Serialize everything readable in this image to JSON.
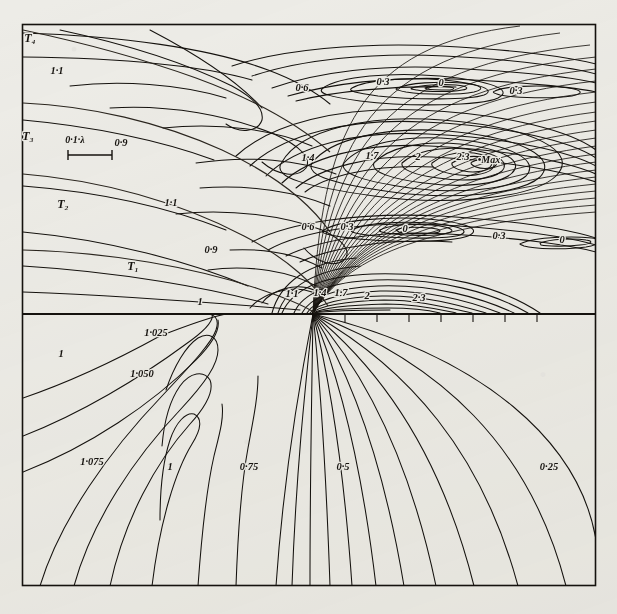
{
  "figure": {
    "kind": "contour-plot",
    "background_color": "#edece7",
    "ink_color": "#15120e",
    "panels": [
      {
        "name": "upper-panel",
        "description": "field intensity contours"
      },
      {
        "name": "lower-panel",
        "description": "near-field contours"
      }
    ],
    "scale_bar": {
      "label": "0·1·λ"
    },
    "max_marker": {
      "label": "•Max"
    }
  },
  "chart_data": {
    "type": "line",
    "title": "",
    "subtitle": "",
    "xlabel": "",
    "ylabel": "",
    "grid": false,
    "legend": "none",
    "axis_divider_y": 314,
    "contour_labels_upper": [
      "1·1",
      "0·9",
      "1·1",
      "0·9",
      "1",
      "0·6",
      "0·3",
      "0",
      "0·3",
      "1·4",
      "1·7",
      "2",
      "2·3",
      "0·6",
      "0·3",
      "0",
      "0·3",
      "0",
      "1·1",
      "1·4",
      "1·7",
      "2",
      "2·3"
    ],
    "contour_labels_lower": [
      "1",
      "1·025",
      "1·050",
      "1·075",
      "1",
      "0·75",
      "0·5",
      "0·25"
    ],
    "ray_labels": [
      "T₁",
      "T₂",
      "T₃",
      "T₄"
    ],
    "annotations": [
      "0·1·λ",
      "•Max"
    ]
  },
  "labels": {
    "rays": [
      {
        "text": "T₄",
        "x": 30,
        "y": 42
      },
      {
        "text": "T₃",
        "x": 28,
        "y": 140
      },
      {
        "text": "T₂",
        "x": 63,
        "y": 208
      },
      {
        "text": "T₁",
        "x": 133,
        "y": 270
      }
    ],
    "scale": {
      "text": "0·1·λ",
      "x": 75,
      "y": 143
    },
    "max": {
      "text": "•Max",
      "x": 489,
      "y": 163
    },
    "upper": [
      {
        "text": "1·1",
        "x": 57,
        "y": 74
      },
      {
        "text": "0·9",
        "x": 121,
        "y": 146
      },
      {
        "text": "1·1",
        "x": 171,
        "y": 206
      },
      {
        "text": "0·9",
        "x": 211,
        "y": 253
      },
      {
        "text": "1",
        "x": 200,
        "y": 305
      },
      {
        "text": "0·6",
        "x": 302,
        "y": 91
      },
      {
        "text": "0·3",
        "x": 383,
        "y": 85
      },
      {
        "text": "0",
        "x": 441,
        "y": 86
      },
      {
        "text": "0·3",
        "x": 516,
        "y": 94
      },
      {
        "text": "1·4",
        "x": 308,
        "y": 161
      },
      {
        "text": "1·7",
        "x": 372,
        "y": 159
      },
      {
        "text": "2",
        "x": 418,
        "y": 160
      },
      {
        "text": "2·3",
        "x": 463,
        "y": 160
      },
      {
        "text": "0·6",
        "x": 308,
        "y": 230
      },
      {
        "text": "0·3",
        "x": 347,
        "y": 230
      },
      {
        "text": "0",
        "x": 405,
        "y": 232
      },
      {
        "text": "0·3",
        "x": 499,
        "y": 239
      },
      {
        "text": "0",
        "x": 562,
        "y": 243
      },
      {
        "text": "1·1",
        "x": 292,
        "y": 297
      },
      {
        "text": "1·4",
        "x": 320,
        "y": 296
      },
      {
        "text": "1·7",
        "x": 341,
        "y": 296
      },
      {
        "text": "2",
        "x": 367,
        "y": 299
      },
      {
        "text": "2·3",
        "x": 419,
        "y": 301
      }
    ],
    "lower": [
      {
        "text": "1",
        "x": 61,
        "y": 357
      },
      {
        "text": "1·025",
        "x": 156,
        "y": 336
      },
      {
        "text": "1·050",
        "x": 142,
        "y": 377
      },
      {
        "text": "1·075",
        "x": 92,
        "y": 465
      },
      {
        "text": "1",
        "x": 170,
        "y": 470
      },
      {
        "text": "0·75",
        "x": 249,
        "y": 470
      },
      {
        "text": "0·5",
        "x": 343,
        "y": 470
      },
      {
        "text": "0·25",
        "x": 549,
        "y": 470
      }
    ]
  }
}
